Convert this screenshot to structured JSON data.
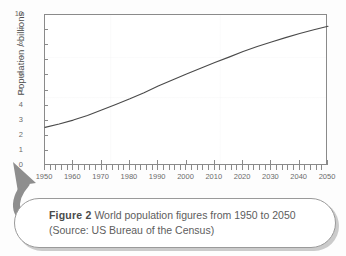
{
  "figure": {
    "caption_label": "Figure 2",
    "caption_text": "World population figures from 1950 to 2050 (Source: US Bureau of the Census)",
    "arrow_icon": "curved-arrow-up-left-icon"
  },
  "colors": {
    "curve": "#4a4a4a",
    "axis": "#8a8a8a",
    "text": "#5d5d5d",
    "caption_border": "#9a9a9a",
    "arrow": "#8e8e8e",
    "plot_background": "#ffffff"
  },
  "chart_data": {
    "type": "line",
    "title": "",
    "xlabel": "",
    "ylabel": "Population / billions",
    "xlim": [
      1950,
      2050
    ],
    "ylim": [
      0,
      10
    ],
    "grid": false,
    "legend": "none",
    "x_ticks": [
      "1950",
      "1960",
      "1970",
      "1980",
      "1990",
      "2000",
      "2010",
      "2020",
      "2030",
      "2040",
      "2050"
    ],
    "y_ticks": [
      "0",
      "1",
      "2",
      "3",
      "4",
      "5",
      "6",
      "7",
      "8",
      "9",
      "10"
    ],
    "x_minor_tick_interval": 2,
    "series": [
      {
        "name": "World population",
        "x": [
          1950,
          1955,
          1960,
          1965,
          1970,
          1975,
          1980,
          1985,
          1990,
          1995,
          2000,
          2005,
          2010,
          2015,
          2020,
          2025,
          2030,
          2035,
          2040,
          2045,
          2050
        ],
        "values": [
          2.56,
          2.78,
          3.04,
          3.35,
          3.71,
          4.08,
          4.45,
          4.85,
          5.29,
          5.7,
          6.09,
          6.47,
          6.85,
          7.21,
          7.58,
          7.91,
          8.21,
          8.5,
          8.77,
          9.02,
          9.25
        ]
      }
    ]
  }
}
